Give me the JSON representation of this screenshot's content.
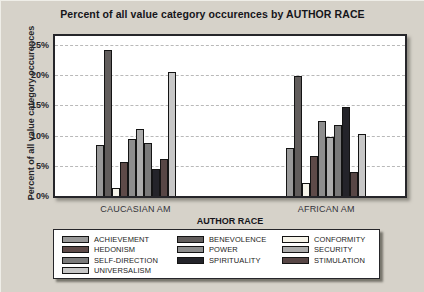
{
  "title": "Percent of all value category occurences by AUTHOR RACE",
  "axis": {
    "x_title": "AUTHOR RACE",
    "y_title": "Percent of all value category occurences"
  },
  "chart_data": {
    "type": "bar",
    "title": "Percent of all value category occurences by AUTHOR RACE",
    "xlabel": "AUTHOR RACE",
    "ylabel": "Percent of all value category occurences",
    "categories": [
      "CAUCASIAN AM",
      "AFRICAN AM"
    ],
    "series": [
      {
        "name": "ACHIEVEMENT",
        "color": "#999999",
        "values": [
          8.4,
          8.0
        ]
      },
      {
        "name": "BENEVOLENCE",
        "color": "#615d5c",
        "values": [
          24.2,
          19.8
        ]
      },
      {
        "name": "CONFORMITY",
        "color": "#f6f4ea",
        "values": [
          1.4,
          2.2
        ]
      },
      {
        "name": "HEDONISM",
        "color": "#5e4a48",
        "values": [
          5.6,
          6.6
        ]
      },
      {
        "name": "POWER",
        "color": "#8d8d8d",
        "values": [
          9.4,
          12.5
        ]
      },
      {
        "name": "SECURITY",
        "color": "#acacac",
        "values": [
          11.1,
          9.7
        ]
      },
      {
        "name": "SELF-DIRECTION",
        "color": "#7a7a7a",
        "values": [
          8.8,
          11.7
        ]
      },
      {
        "name": "SPIRITUALITY",
        "color": "#24242a",
        "values": [
          4.4,
          14.7
        ]
      },
      {
        "name": "STIMULATION",
        "color": "#574645",
        "values": [
          6.2,
          3.9
        ]
      },
      {
        "name": "UNIVERSALISM",
        "color": "#c7c7c7",
        "values": [
          20.6,
          10.3
        ]
      }
    ],
    "ylim": [
      0,
      26.5
    ],
    "yticks": [
      0,
      5,
      10,
      15,
      20,
      25
    ],
    "ytick_labels": [
      "0%",
      "5%",
      "10%",
      "15%",
      "20%",
      "25%"
    ],
    "grid": "horizontal-dashed",
    "legend_position": "bottom",
    "legend_title": "AUTHOR RACE",
    "cluster_centers_pct": [
      23,
      77.5
    ]
  },
  "legend": {
    "title": "AUTHOR RACE"
  }
}
